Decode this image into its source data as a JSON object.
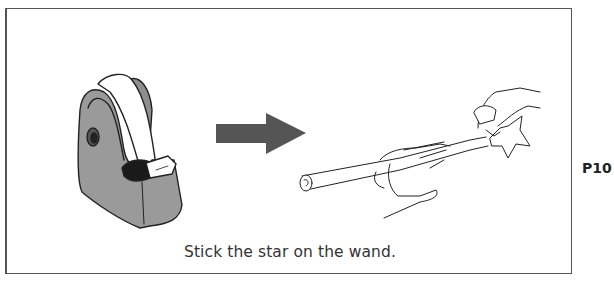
{
  "instruction": {
    "caption": "Stick the star on the wand.",
    "page_number": "P10"
  },
  "illustrations": {
    "left": "tape-dispenser",
    "connector": "arrow-right",
    "right": "hands-sticking-star-on-wand"
  },
  "colors": {
    "frame": "#555555",
    "arrow": "#555555",
    "dispenser_body": "#9a9a9a",
    "text": "#333333"
  }
}
